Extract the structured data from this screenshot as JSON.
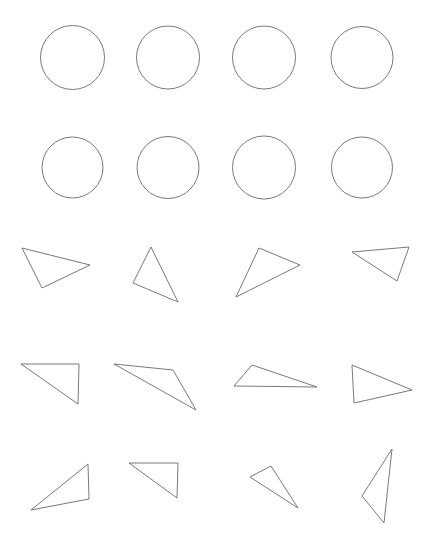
{
  "canvas": {
    "width": 434,
    "height": 554,
    "background_color": "#ffffff",
    "stroke_color": "#666a6e",
    "stroke_width": 0.9
  },
  "figure": {
    "type": "shape-grid",
    "rows": 5,
    "columns": 4,
    "shape_counts": {
      "circles": 8,
      "triangles": 12,
      "total": 20
    }
  },
  "shapes": {
    "circles": [
      {
        "name": "circle-r1-c1",
        "cx": 72.5,
        "cy": 57.5,
        "r": 32.0
      },
      {
        "name": "circle-r1-c2",
        "cx": 168.0,
        "cy": 57.5,
        "r": 31.5
      },
      {
        "name": "circle-r1-c3",
        "cx": 264.0,
        "cy": 57.5,
        "r": 31.5
      },
      {
        "name": "circle-r1-c4",
        "cx": 362.0,
        "cy": 57.5,
        "r": 31.0
      },
      {
        "name": "circle-r2-c1",
        "cx": 72.5,
        "cy": 167.5,
        "r": 30.5
      },
      {
        "name": "circle-r2-c2",
        "cx": 168.0,
        "cy": 167.5,
        "r": 31.0
      },
      {
        "name": "circle-r2-c3",
        "cx": 264.0,
        "cy": 167.5,
        "r": 31.5
      },
      {
        "name": "circle-r2-c4",
        "cx": 362.0,
        "cy": 167.5,
        "r": 30.5
      }
    ],
    "triangles": [
      {
        "name": "triangle-r3-c1",
        "points": "22,248 90,265 42,288"
      },
      {
        "name": "triangle-r3-c2",
        "points": "151,247 133,283 178,302"
      },
      {
        "name": "triangle-r3-c3",
        "points": "259,248 300,265 236,297"
      },
      {
        "name": "triangle-r3-c4",
        "points": "352,252 409,247 397,281"
      },
      {
        "name": "triangle-r4-c1",
        "points": "21,364 79,364 78,404"
      },
      {
        "name": "triangle-r4-c2",
        "points": "114,364 173,370 196,410"
      },
      {
        "name": "triangle-r4-c3",
        "points": "252,365 317,387 234,386"
      },
      {
        "name": "triangle-r4-c4",
        "points": "352,365 412,390 354,403"
      },
      {
        "name": "triangle-r5-c1",
        "points": "88,464 89,499 31,510"
      },
      {
        "name": "triangle-r5-c2",
        "points": "129,463 178,463 177,498"
      },
      {
        "name": "triangle-r5-c3",
        "points": "271,466 250,477 298,508"
      },
      {
        "name": "triangle-r5-c4",
        "points": "392,449 362,496 384,523"
      }
    ]
  }
}
